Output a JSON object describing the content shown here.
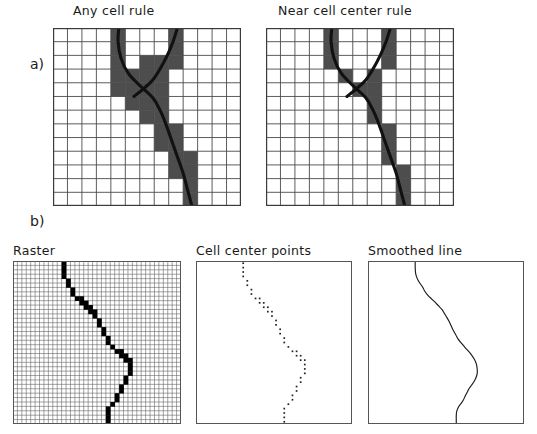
{
  "figure": {
    "sections": [
      {
        "key": "a",
        "label": "a)"
      },
      {
        "key": "b",
        "label": "b)"
      }
    ]
  },
  "panels": {
    "any_cell_rule": {
      "title": "Any cell rule",
      "type": "raster-grid-with-line",
      "grid_cols": 13,
      "grid_rows": 13,
      "shaded_color": "#4d4d4d",
      "line_color": "#111111"
    },
    "near_cell_center_rule": {
      "title": "Near cell center rule",
      "type": "raster-grid-with-line",
      "grid_cols": 13,
      "grid_rows": 13,
      "shaded_color": "#4d4d4d",
      "line_color": "#111111"
    },
    "raster": {
      "title": "Raster",
      "type": "fine-raster-grid",
      "grid_cols": 38,
      "grid_rows": 37,
      "cell_color": "#000000"
    },
    "cell_center_points": {
      "title": "Cell center points",
      "type": "scatter",
      "point_color": "#222222"
    },
    "smoothed_line": {
      "title": "Smoothed line",
      "type": "line",
      "line_color": "#1a1a1a"
    }
  },
  "chart_data": [
    {
      "type": "heatmap",
      "name": "any_cell_rule",
      "title": "Any cell rule",
      "xlabel": "",
      "ylabel": "",
      "grid": {
        "cols": 13,
        "rows": 13
      },
      "legend": [],
      "notes": "Cells selected by the 'any cell' rule: every grid cell touched anywhere by the vector line is shaded.",
      "shaded_cells": [
        [
          4,
          0
        ],
        [
          8,
          0
        ],
        [
          4,
          1
        ],
        [
          8,
          1
        ],
        [
          4,
          2
        ],
        [
          6,
          2
        ],
        [
          7,
          2
        ],
        [
          8,
          2
        ],
        [
          4,
          3
        ],
        [
          5,
          3
        ],
        [
          6,
          3
        ],
        [
          7,
          3
        ],
        [
          4,
          4
        ],
        [
          5,
          4
        ],
        [
          6,
          4
        ],
        [
          7,
          4
        ],
        [
          5,
          5
        ],
        [
          6,
          5
        ],
        [
          7,
          5
        ],
        [
          6,
          6
        ],
        [
          7,
          6
        ],
        [
          7,
          7
        ],
        [
          8,
          7
        ],
        [
          7,
          8
        ],
        [
          8,
          8
        ],
        [
          8,
          9
        ],
        [
          9,
          9
        ],
        [
          8,
          10
        ],
        [
          9,
          10
        ],
        [
          9,
          11
        ],
        [
          9,
          12
        ]
      ],
      "line_path": [
        [
          4.55,
          0.0
        ],
        [
          4.5,
          1.0
        ],
        [
          4.7,
          2.2
        ],
        [
          5.2,
          3.3
        ],
        [
          6.0,
          4.2
        ],
        [
          6.9,
          5.1
        ],
        [
          7.4,
          6.0
        ],
        [
          7.8,
          7.0
        ],
        [
          8.2,
          8.2
        ],
        [
          8.6,
          9.4
        ],
        [
          9.0,
          10.6
        ],
        [
          9.3,
          11.8
        ],
        [
          9.6,
          13.0
        ]
      ],
      "line_path_branch": [
        [
          8.6,
          0.0
        ],
        [
          8.3,
          1.0
        ],
        [
          7.9,
          2.0
        ],
        [
          7.4,
          3.0
        ],
        [
          6.9,
          3.8
        ],
        [
          6.3,
          4.4
        ],
        [
          5.6,
          5.0
        ]
      ]
    },
    {
      "type": "heatmap",
      "name": "near_cell_center_rule",
      "title": "Near cell center rule",
      "xlabel": "",
      "ylabel": "",
      "grid": {
        "cols": 13,
        "rows": 13
      },
      "legend": [],
      "notes": "Cells selected by the 'near cell center' rule: only cells whose center lies close to the vector line are shaded — a sparser set than the 'any cell' rule.",
      "shaded_cells": [
        [
          4,
          0
        ],
        [
          8,
          0
        ],
        [
          4,
          1
        ],
        [
          8,
          1
        ],
        [
          4,
          2
        ],
        [
          8,
          2
        ],
        [
          5,
          3
        ],
        [
          7,
          3
        ],
        [
          6,
          4
        ],
        [
          7,
          4
        ],
        [
          7,
          5
        ],
        [
          7,
          6
        ],
        [
          8,
          7
        ],
        [
          8,
          8
        ],
        [
          8,
          9
        ],
        [
          9,
          10
        ],
        [
          9,
          11
        ],
        [
          9,
          12
        ]
      ],
      "line_path": [
        [
          4.55,
          0.0
        ],
        [
          4.5,
          1.0
        ],
        [
          4.7,
          2.2
        ],
        [
          5.2,
          3.3
        ],
        [
          6.0,
          4.2
        ],
        [
          6.9,
          5.1
        ],
        [
          7.4,
          6.0
        ],
        [
          7.8,
          7.0
        ],
        [
          8.2,
          8.2
        ],
        [
          8.6,
          9.4
        ],
        [
          9.0,
          10.6
        ],
        [
          9.3,
          11.8
        ],
        [
          9.6,
          13.0
        ]
      ],
      "line_path_branch": [
        [
          8.6,
          0.0
        ],
        [
          8.3,
          1.0
        ],
        [
          7.9,
          2.0
        ],
        [
          7.4,
          3.0
        ],
        [
          6.9,
          3.8
        ],
        [
          6.3,
          4.4
        ],
        [
          5.6,
          5.0
        ]
      ]
    },
    {
      "type": "heatmap",
      "name": "raster",
      "title": "Raster",
      "xlabel": "",
      "ylabel": "",
      "grid": {
        "cols": 38,
        "rows": 37
      },
      "legend": [],
      "notes": "A fine raster in which a stair-stepped chain of black cells traces the course of a line feature.",
      "cells": [
        [
          11,
          0
        ],
        [
          11,
          1
        ],
        [
          11,
          2
        ],
        [
          11,
          3
        ],
        [
          12,
          4
        ],
        [
          12,
          5
        ],
        [
          13,
          6
        ],
        [
          13,
          7
        ],
        [
          14,
          8
        ],
        [
          15,
          8
        ],
        [
          15,
          9
        ],
        [
          16,
          9
        ],
        [
          16,
          10
        ],
        [
          17,
          10
        ],
        [
          17,
          11
        ],
        [
          18,
          11
        ],
        [
          18,
          12
        ],
        [
          19,
          13
        ],
        [
          19,
          14
        ],
        [
          20,
          15
        ],
        [
          20,
          16
        ],
        [
          21,
          17
        ],
        [
          21,
          18
        ],
        [
          22,
          19
        ],
        [
          23,
          20
        ],
        [
          24,
          20
        ],
        [
          24,
          21
        ],
        [
          25,
          21
        ],
        [
          25,
          22
        ],
        [
          26,
          22
        ],
        [
          26,
          23
        ],
        [
          26,
          24
        ],
        [
          26,
          25
        ],
        [
          25,
          26
        ],
        [
          25,
          27
        ],
        [
          24,
          28
        ],
        [
          24,
          29
        ],
        [
          23,
          30
        ],
        [
          23,
          31
        ],
        [
          22,
          32
        ],
        [
          21,
          33
        ],
        [
          21,
          34
        ],
        [
          21,
          35
        ],
        [
          21,
          36
        ]
      ]
    },
    {
      "type": "scatter",
      "name": "cell_center_points",
      "title": "Cell center points",
      "xlabel": "",
      "ylabel": "",
      "xlim": [
        0,
        38
      ],
      "ylim": [
        0,
        37
      ],
      "grid": false,
      "legend": [],
      "notes": "Centroids of the black raster cells, plotted as a dotted point cloud that outlines the same line.",
      "points": [
        [
          11.5,
          0.5
        ],
        [
          11.5,
          1.5
        ],
        [
          11.5,
          2.5
        ],
        [
          11.5,
          3.5
        ],
        [
          12.5,
          4.5
        ],
        [
          12.5,
          5.5
        ],
        [
          13.5,
          6.5
        ],
        [
          13.5,
          7.5
        ],
        [
          14.5,
          8.5
        ],
        [
          15.5,
          8.5
        ],
        [
          15.5,
          9.5
        ],
        [
          16.5,
          9.5
        ],
        [
          16.5,
          10.5
        ],
        [
          17.5,
          10.5
        ],
        [
          17.5,
          11.5
        ],
        [
          18.5,
          11.5
        ],
        [
          18.5,
          12.5
        ],
        [
          19.5,
          13.5
        ],
        [
          19.5,
          14.5
        ],
        [
          20.5,
          15.5
        ],
        [
          20.5,
          16.5
        ],
        [
          21.5,
          17.5
        ],
        [
          21.5,
          18.5
        ],
        [
          22.5,
          19.5
        ],
        [
          23.5,
          20.5
        ],
        [
          24.5,
          20.5
        ],
        [
          24.5,
          21.5
        ],
        [
          25.5,
          21.5
        ],
        [
          25.5,
          22.5
        ],
        [
          26.5,
          22.5
        ],
        [
          26.5,
          23.5
        ],
        [
          26.5,
          24.5
        ],
        [
          26.5,
          25.5
        ],
        [
          25.5,
          26.5
        ],
        [
          25.5,
          27.5
        ],
        [
          24.5,
          28.5
        ],
        [
          24.5,
          29.5
        ],
        [
          23.5,
          30.5
        ],
        [
          23.5,
          31.5
        ],
        [
          22.5,
          32.5
        ],
        [
          21.5,
          33.5
        ],
        [
          21.5,
          34.5
        ],
        [
          21.5,
          35.5
        ],
        [
          21.5,
          36.5
        ]
      ]
    },
    {
      "type": "line",
      "name": "smoothed_line",
      "title": "Smoothed line",
      "xlabel": "",
      "ylabel": "",
      "xlim": [
        0,
        38
      ],
      "ylim": [
        0,
        37
      ],
      "grid": false,
      "legend": [],
      "notes": "A smooth vector line fitted through the cell center points, removing the raster stair-steps.",
      "x": [
        11.5,
        11.5,
        11.6,
        12.0,
        12.6,
        13.3,
        13.8,
        14.6,
        15.6,
        16.4,
        17.2,
        18.0,
        18.6,
        19.2,
        19.8,
        20.3,
        20.8,
        21.4,
        22.0,
        22.8,
        23.6,
        24.4,
        25.2,
        25.9,
        26.4,
        26.6,
        26.6,
        26.3,
        25.8,
        25.2,
        24.6,
        24.1,
        23.6,
        23.2,
        22.6,
        22.0,
        21.6,
        21.5,
        21.5,
        21.5
      ],
      "y": [
        0.0,
        1.4,
        2.8,
        4.0,
        5.0,
        5.9,
        6.8,
        7.8,
        8.7,
        9.4,
        10.2,
        11.0,
        11.9,
        12.8,
        13.8,
        14.8,
        15.8,
        16.8,
        17.8,
        18.7,
        19.6,
        20.4,
        21.3,
        22.3,
        23.4,
        24.5,
        25.5,
        26.5,
        27.4,
        28.2,
        29.0,
        29.9,
        30.8,
        31.6,
        32.4,
        33.2,
        34.2,
        35.1,
        36.0,
        37.0
      ]
    }
  ]
}
